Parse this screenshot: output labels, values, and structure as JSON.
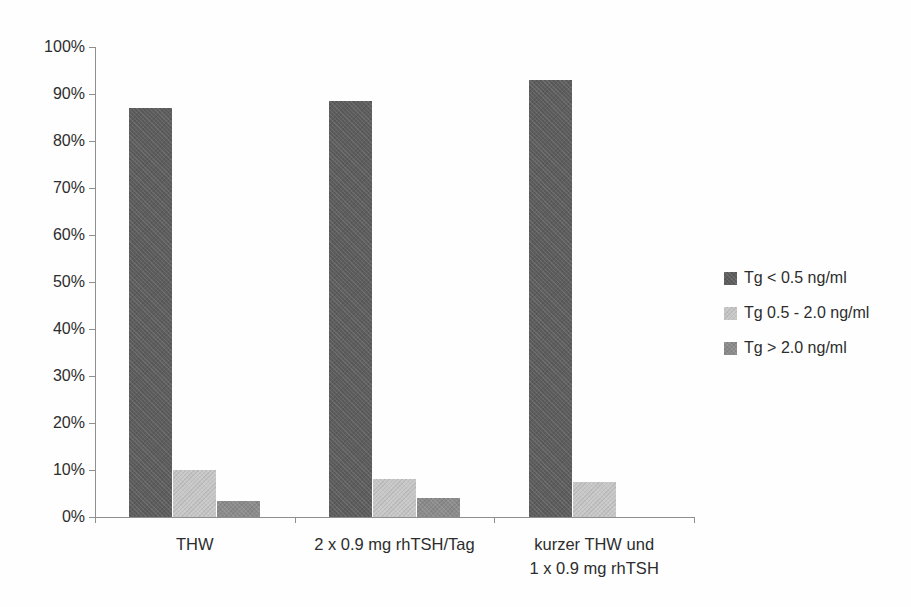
{
  "chart_data": {
    "type": "bar",
    "title": "",
    "xlabel": "",
    "ylabel": "",
    "categories": [
      {
        "label_lines": [
          "THW"
        ]
      },
      {
        "label_lines": [
          "2 x 0.9 mg rhTSH/Tag"
        ]
      },
      {
        "label_lines": [
          "kurzer THW und",
          "1 x 0.9 mg rhTSH"
        ]
      }
    ],
    "series": [
      {
        "name": "Tg < 0.5 ng/ml",
        "color": "#5d5d5d",
        "values": [
          87,
          88.5,
          93
        ]
      },
      {
        "name": "Tg 0.5 - 2.0 ng/ml",
        "color": "#c7c7c7",
        "values": [
          10,
          8,
          7.5
        ]
      },
      {
        "name": "Tg > 2.0 ng/ml",
        "color": "#8b8b8b",
        "values": [
          3.5,
          4,
          0
        ]
      }
    ],
    "y_axis": {
      "min": 0,
      "max": 100,
      "tick_step": 10,
      "tick_labels": [
        "100%",
        "90%",
        "80%",
        "70%",
        "60%",
        "50%",
        "40%",
        "30%",
        "20%",
        "10%",
        "0%"
      ]
    },
    "legend": {
      "position": "right",
      "entries": [
        "Tg < 0.5 ng/ml",
        "Tg 0.5 - 2.0 ng/ml",
        "Tg > 2.0 ng/ml"
      ]
    },
    "grid": false,
    "axis_color": "#8f8f8f",
    "text_color": "#2d2d2d"
  }
}
